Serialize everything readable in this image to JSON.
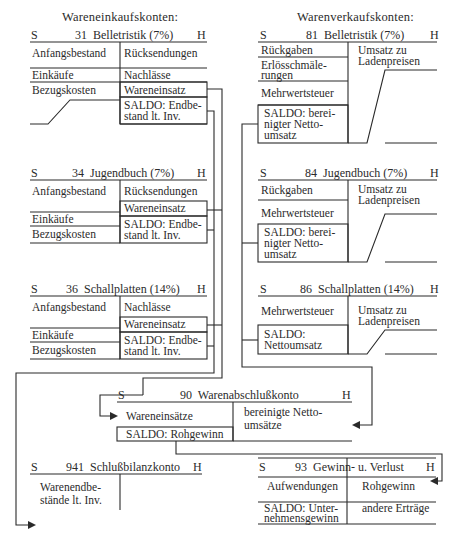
{
  "sections": {
    "purchase": "Wareneinkaufskonten:",
    "sales": "Warenverkaufskonten:"
  },
  "side_labels": {
    "debit": "S",
    "credit": "H"
  },
  "accounts": {
    "a31": {
      "title": "31  Belletristik (7%)",
      "debit": [
        "Anfangsbestand",
        "Einkäufe",
        "Bezugskosten"
      ],
      "credit": [
        "Rücksendungen",
        "Nachlässe",
        "Wareneinsatz",
        "SALDO: Endbe-",
        "stand lt. Inv."
      ]
    },
    "a34": {
      "title": "34  Jugendbuch (7%)",
      "debit": [
        "Anfangsbestand",
        "Einkäufe",
        "Bezugskosten"
      ],
      "credit": [
        "Rücksendungen",
        "Wareneinsatz",
        "SALDO: Endbe-",
        "stand lt. Inv."
      ]
    },
    "a36": {
      "title": "36  Schallplatten (14%)",
      "debit": [
        "Anfangsbestand",
        "Einkäufe",
        "Bezugskosten"
      ],
      "credit": [
        "Nachlässe",
        "Wareneinsatz",
        "SALDO: Endbe-",
        "stand lt. Inv."
      ]
    },
    "a81": {
      "title": "81  Belletristik (7%)",
      "debit": [
        "Rückgaben",
        "Erlösschmäle-",
        "rungen",
        "Mehrwertsteuer",
        "SALDO: berei-",
        "nigter Netto-",
        "umsatz"
      ],
      "credit": [
        "Umsatz zu",
        "Ladenpreisen"
      ]
    },
    "a84": {
      "title": "84  Jugendbuch (7%)",
      "debit": [
        "Rückgaben",
        "Mehrwertsteuer",
        "SALDO: berei-",
        "nigter Netto-",
        "umsatz"
      ],
      "credit": [
        "Umsatz zu",
        "Ladenpreisen"
      ]
    },
    "a86": {
      "title": "86  Schallplatten (14%)",
      "debit": [
        "Mehrwertsteuer",
        "SALDO:",
        "Nettoumsatz"
      ],
      "credit": [
        "Umsatz zu",
        "Ladenpreisen"
      ]
    },
    "a90": {
      "title": "90  Warenabschlußkonto",
      "debit": [
        "Wareneinsätze",
        "SALDO: Rohgewinn"
      ],
      "credit": [
        "bereinigte Netto-",
        "umsätze"
      ]
    },
    "a941": {
      "title": "941  Schlußbilanzkonto",
      "debit": [
        "Warenendbe-",
        "stände lt. Inv."
      ]
    },
    "a93": {
      "title": "93  Gewinn- u. Verlust",
      "debit": [
        "Aufwendungen",
        "SALDO: Unter-",
        "nehmensgewinn"
      ],
      "credit": [
        "Rohgewinn",
        "andere Erträge"
      ]
    }
  }
}
